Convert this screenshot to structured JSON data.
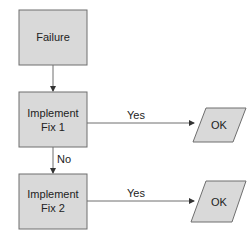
{
  "diagram": {
    "type": "flowchart",
    "colors": {
      "box_fill": "#d9d9d9",
      "box_stroke": "#6e6e6e",
      "line": "#6e6e6e",
      "text": "#222222",
      "background": "#ffffff"
    },
    "nodes": [
      {
        "id": "failure",
        "shape": "rectangle",
        "lines": [
          "Failure"
        ]
      },
      {
        "id": "fix1",
        "shape": "rectangle",
        "lines": [
          "Implement",
          "Fix 1"
        ]
      },
      {
        "id": "fix2",
        "shape": "rectangle",
        "lines": [
          "Implement",
          "Fix 2"
        ]
      },
      {
        "id": "ok1",
        "shape": "parallelogram",
        "lines": [
          "OK"
        ]
      },
      {
        "id": "ok2",
        "shape": "parallelogram",
        "lines": [
          "OK"
        ]
      }
    ],
    "edges": [
      {
        "from": "failure",
        "to": "fix1",
        "label": ""
      },
      {
        "from": "fix1",
        "to": "ok1",
        "label": "Yes"
      },
      {
        "from": "fix1",
        "to": "fix2",
        "label": "No"
      },
      {
        "from": "fix2",
        "to": "ok2",
        "label": "Yes"
      }
    ]
  }
}
